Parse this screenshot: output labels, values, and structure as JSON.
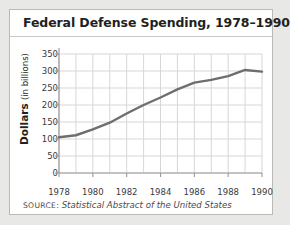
{
  "figure": {
    "title": "Federal Defense Spending, 1978–1990",
    "source_prefix": "SOURCE:",
    "source_text": "Statistical Abstract of the United States",
    "panel_background": "#ffffff",
    "page_background": "#e8e8e6",
    "border_color": "#b9b9b7"
  },
  "chart_data": {
    "type": "line",
    "title": "Federal Defense Spending, 1978–1990",
    "xlabel": "",
    "ylabel": "Dollars (in billions)",
    "ylabel_main": "Dollars",
    "ylabel_sub": "(in billions)",
    "x": [
      1978,
      1979,
      1980,
      1981,
      1982,
      1983,
      1984,
      1985,
      1986,
      1987,
      1988,
      1989,
      1990
    ],
    "values": [
      105,
      111,
      128,
      148,
      175,
      200,
      222,
      246,
      266,
      274,
      285,
      303,
      298
    ],
    "series": [
      {
        "name": "Federal defense spending",
        "color": "#6e6e6e",
        "values": [
          105,
          111,
          128,
          148,
          175,
          200,
          222,
          246,
          266,
          274,
          285,
          303,
          298
        ]
      }
    ],
    "xlim": [
      1978,
      1990
    ],
    "ylim": [
      0,
      350
    ],
    "ytick_values": [
      0,
      50,
      100,
      150,
      200,
      250,
      300,
      350
    ],
    "ytick_labels": [
      "0",
      "50",
      "100",
      "150",
      "200",
      "250",
      "300",
      "350"
    ],
    "xtick_values": [
      1978,
      1980,
      1982,
      1984,
      1986,
      1988,
      1990
    ],
    "xtick_labels": [
      "1978",
      "1980",
      "1982",
      "1984",
      "1986",
      "1988",
      "1990"
    ],
    "grid": true,
    "grid_color": "#d7d7d7",
    "axis_color": "#9a9a9a",
    "legend": "none",
    "line_width_px": 2.4
  }
}
